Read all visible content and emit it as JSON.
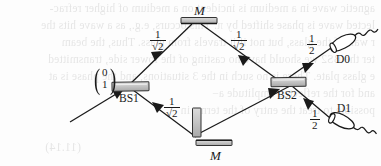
{
  "figure": {
    "type": "optics-diagram",
    "name": "mach-zehnder-interferometer",
    "equation_number": "(11.14)"
  },
  "components": {
    "beam_splitter_1": {
      "label": "BS1"
    },
    "beam_splitter_2": {
      "label": "BS2"
    },
    "mirror_top": {
      "label": "M"
    },
    "mirror_bottom": {
      "label": "M"
    },
    "phase_plate": {
      "label": ""
    },
    "detector_0": {
      "label": "D0"
    },
    "detector_1": {
      "label": "D1"
    }
  },
  "amplitudes": {
    "upper_in": {
      "numerator": "1",
      "denominator": "√2"
    },
    "upper_out": {
      "numerator": "1",
      "denominator": "√2"
    },
    "lower_in": {
      "numerator": "1",
      "denominator": "√2"
    },
    "lower_out": {
      "numerator": "1",
      "denominator": "√2"
    },
    "to_d0": {
      "numerator": "1",
      "denominator": "2"
    },
    "to_d1": {
      "numerator": "1",
      "denominator": "2"
    }
  },
  "input_state": {
    "top_component": "0",
    "bottom_component": "1"
  },
  "colors": {
    "ink": "#1a1a1a",
    "optic_fill": "#c9c9c9",
    "optic_stroke": "#3a3a3a",
    "page": "#fdfdfd",
    "bleed_ink": "#4a4a4a"
  },
  "bleed_text": {
    "line_0": "agnetic wave in a medium is incident on a medium of higher refrac-",
    "line_1": "lected wave is phase shifted by π. This occurs, e.g., as a wave hits the",
    "line_2": "r wall of the glass, but not if it travels from glass. Thus, the beam",
    "line_3": "ter the BS2 we should have no casting of the lower side, transmitted",
    "line_4": "e glass plate. There is no such in the 3 situations, and the phase is at",
    "line_5": "and for the reflected amplitude a−",
    "line_6": "possible to treat the entry of the terms in",
    "equation_number": "(11.14)"
  }
}
